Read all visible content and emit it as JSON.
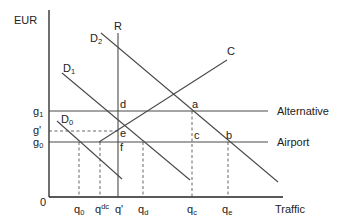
{
  "diagram": {
    "y_axis_label": "EUR",
    "x_axis_label": "Traffic",
    "origin_label": "0",
    "colors": {
      "line": "#4a4a4a",
      "axis": "#222222",
      "text": "#222222",
      "background": "#ffffff"
    },
    "price_levels": [
      {
        "id": "g1",
        "base": "g",
        "sub": "1",
        "line_label": "Alternative",
        "style": "solid"
      },
      {
        "id": "gprime",
        "base": "g'",
        "sub": "",
        "line_label": "",
        "style": "dashed"
      },
      {
        "id": "g0",
        "base": "g",
        "sub": "0",
        "line_label": "Airport",
        "style": "solid"
      }
    ],
    "curves": [
      {
        "id": "R",
        "label": "R",
        "type": "vertical capacity line"
      },
      {
        "id": "D2",
        "base": "D",
        "sub": "2",
        "type": "demand"
      },
      {
        "id": "D1",
        "base": "D",
        "sub": "1",
        "type": "demand"
      },
      {
        "id": "D0",
        "base": "D",
        "sub": "0",
        "type": "demand"
      },
      {
        "id": "C",
        "label": "C",
        "type": "cost / supply"
      }
    ],
    "points": [
      {
        "id": "a",
        "label": "a"
      },
      {
        "id": "b",
        "label": "b"
      },
      {
        "id": "c",
        "label": "c"
      },
      {
        "id": "d",
        "label": "d"
      },
      {
        "id": "e",
        "label": "e"
      },
      {
        "id": "f",
        "label": "f"
      }
    ],
    "quantity_ticks": [
      {
        "id": "q0",
        "base": "q",
        "sub": "0",
        "sup": ""
      },
      {
        "id": "qdc",
        "base": "q",
        "sub": "",
        "sup": "dc"
      },
      {
        "id": "qprime",
        "base": "q'",
        "sub": "",
        "sup": ""
      },
      {
        "id": "qd",
        "base": "q",
        "sub": "d",
        "sup": ""
      },
      {
        "id": "qc",
        "base": "q",
        "sub": "c",
        "sup": ""
      },
      {
        "id": "qe",
        "base": "q",
        "sub": "e",
        "sup": ""
      }
    ]
  }
}
